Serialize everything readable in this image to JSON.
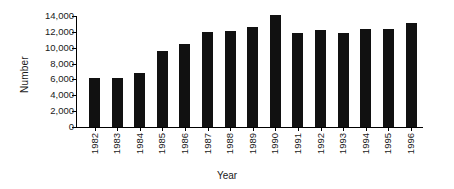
{
  "chart_data": {
    "type": "bar",
    "title": "",
    "xlabel": "Year",
    "ylabel": "Number",
    "categories": [
      "1982",
      "1983",
      "1984",
      "1985",
      "1986",
      "1987",
      "1988",
      "1989",
      "1990",
      "1991",
      "1992",
      "1993",
      "1994",
      "1995",
      "1996"
    ],
    "values": [
      6200,
      6200,
      6800,
      9600,
      10500,
      12000,
      12100,
      12600,
      14100,
      11900,
      12200,
      11800,
      12300,
      12300,
      13100
    ],
    "series": [
      {
        "name": "Number",
        "values": [
          6200,
          6200,
          6800,
          9600,
          10500,
          12000,
          12100,
          12600,
          14100,
          11900,
          12200,
          11800,
          12300,
          12300,
          13100
        ]
      }
    ],
    "ylim": [
      0,
      14000
    ],
    "ytick_labels": [
      "14,000",
      "12,000",
      "10,000",
      "8,000",
      "6,000",
      "4,000",
      "2,000",
      "0"
    ],
    "ytick_values": [
      14000,
      12000,
      10000,
      8000,
      6000,
      4000,
      2000,
      0
    ],
    "grid": false,
    "legend": false,
    "legend_position": "none",
    "bar_color": "#111111",
    "axis_color": "#000000",
    "background_color": "#ffffff",
    "xtick_label_rotation": 90
  }
}
